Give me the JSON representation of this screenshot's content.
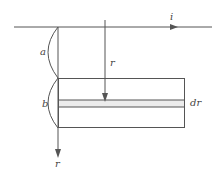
{
  "diagram": {
    "labels": {
      "current": "i",
      "distance_a": "a",
      "width_b": "b",
      "radius": "r",
      "axis_r": "r",
      "strip": "dr"
    },
    "colors": {
      "line": "#555555",
      "strip_fill": "#ececec"
    }
  }
}
